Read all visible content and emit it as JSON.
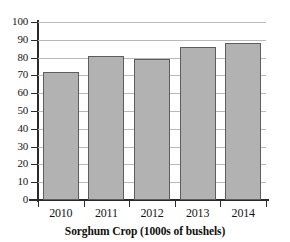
{
  "chart_data": {
    "type": "bar",
    "title": "Sorghum Crop (1000s of bushels)",
    "xlabel": "",
    "ylabel": "",
    "categories": [
      "2010",
      "2011",
      "2012",
      "2013",
      "2014"
    ],
    "values": [
      72,
      81,
      79,
      86,
      88
    ],
    "series": [
      {
        "name": "Sorghum Crop",
        "values": [
          72,
          81,
          79,
          86,
          88
        ]
      }
    ],
    "ylim": [
      0,
      100
    ],
    "ytick_labels": [
      "100",
      "90",
      "80",
      "70",
      "60",
      "50",
      "40",
      "30",
      "20",
      "10",
      "0"
    ],
    "ytick_values": [
      100,
      90,
      80,
      70,
      60,
      50,
      40,
      30,
      20,
      10,
      0
    ],
    "ytick_step": 10,
    "grid": true,
    "grid_axis": "y",
    "legend": false,
    "legend_position": "none",
    "bar_fill_color": "#b2b2b2",
    "bar_edge_color": "#5d5d5d",
    "gridline_color": "#b9b9b9",
    "axis_color": "#2b2b2b",
    "background_color": "#ffffff"
  }
}
